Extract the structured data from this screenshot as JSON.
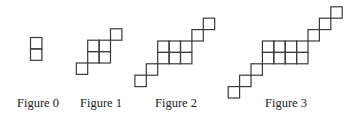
{
  "square_size": 11.4,
  "stroke_color": "#3a3a3a",
  "figures": [
    {
      "label": "Figure 0",
      "label_x": 17,
      "squares": [
        [
          30.5,
          37.5
        ],
        [
          30.5,
          48.9
        ]
      ]
    },
    {
      "label": "Figure 1",
      "label_x": 80,
      "squares": [
        [
          110.5,
          28.8
        ],
        [
          87.7,
          40.2
        ],
        [
          99.1,
          40.2
        ],
        [
          87.7,
          51.6
        ],
        [
          99.1,
          51.6
        ],
        [
          76.3,
          63.0
        ]
      ]
    },
    {
      "label": "Figure 2",
      "label_x": 155,
      "squares": [
        [
          203.3,
          18.2
        ],
        [
          191.9,
          29.6
        ],
        [
          157.7,
          41.0
        ],
        [
          169.1,
          41.0
        ],
        [
          180.5,
          41.0
        ],
        [
          157.7,
          52.4
        ],
        [
          169.1,
          52.4
        ],
        [
          180.5,
          52.4
        ],
        [
          146.3,
          63.8
        ],
        [
          134.9,
          75.2
        ]
      ]
    },
    {
      "label": "Figure 3",
      "label_x": 265,
      "squares": [
        [
          330.8,
          6.8
        ],
        [
          319.4,
          18.2
        ],
        [
          308.0,
          29.6
        ],
        [
          262.4,
          41.0
        ],
        [
          273.8,
          41.0
        ],
        [
          285.2,
          41.0
        ],
        [
          296.6,
          41.0
        ],
        [
          262.4,
          52.4
        ],
        [
          273.8,
          52.4
        ],
        [
          285.2,
          52.4
        ],
        [
          296.6,
          52.4
        ],
        [
          251.0,
          63.8
        ],
        [
          239.6,
          75.2
        ],
        [
          228.2,
          86.6
        ]
      ]
    }
  ],
  "labels": {
    "fig0": "Figure 0",
    "fig1": "Figure 1",
    "fig2": "Figure 2",
    "fig3": "Figure 3"
  }
}
